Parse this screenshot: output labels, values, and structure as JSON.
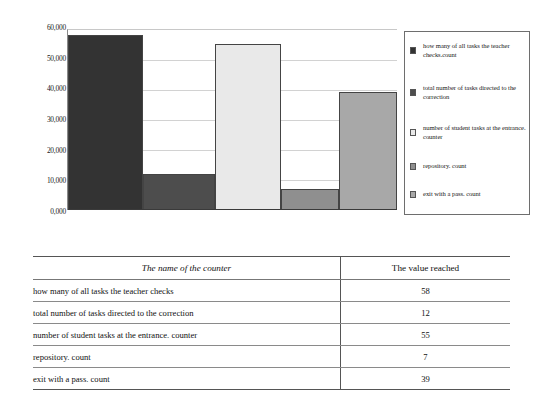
{
  "chart_data": {
    "type": "bar",
    "title": "",
    "xlabel": "",
    "ylabel": "",
    "categories": [
      "how many of all tasks the teacher checks.count",
      "total number of tasks directed to the correction",
      "number of student tasks at the entrance. counter",
      "repository. count",
      "exit with a pass. count"
    ],
    "values": [
      58000,
      12000,
      55000,
      7000,
      39000
    ],
    "ylim": [
      0,
      60000
    ],
    "yticks": [
      0,
      10000,
      20000,
      30000,
      40000,
      50000,
      60000
    ],
    "ytick_labels": [
      "0,000",
      "10,000",
      "20,000",
      "30,000",
      "40,000",
      "50,000",
      "60,000"
    ],
    "grid": true,
    "legend_position": "right",
    "series_colors": [
      "#333333",
      "#4d4d4d",
      "#e9e9e9",
      "#8f8f8f",
      "#a8a8a8"
    ]
  },
  "chart": {
    "legend": {
      "items": [
        {
          "label": "how many of all tasks the teacher checks.count",
          "color": "#333333"
        },
        {
          "label": "total number of tasks directed to the correction",
          "color": "#4d4d4d"
        },
        {
          "label": "number of student tasks at the entrance. counter",
          "color": "#e9e9e9"
        },
        {
          "label": "repository. count",
          "color": "#8f8f8f"
        },
        {
          "label": "exit with a pass. count",
          "color": "#a8a8a8"
        }
      ]
    }
  },
  "table": {
    "headers": [
      "The name of the counter",
      "The value reached"
    ],
    "rows": [
      {
        "name": "how many of all tasks the teacher checks",
        "value": "58"
      },
      {
        "name": "total number of tasks directed to the correction",
        "value": "12"
      },
      {
        "name": "number of student tasks at the entrance. counter",
        "value": "55"
      },
      {
        "name": "repository. count",
        "value": "7"
      },
      {
        "name": "exit with a pass. count",
        "value": "39"
      }
    ]
  }
}
